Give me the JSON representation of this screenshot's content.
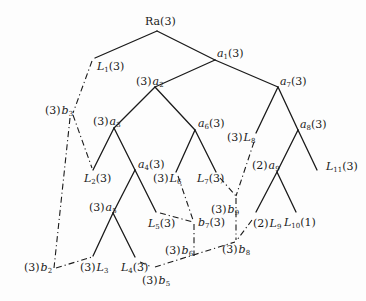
{
  "diagram": {
    "type": "tree",
    "root": "Ra(3)",
    "nodes": [
      {
        "id": "Ra",
        "label": "Ra",
        "mult": "3",
        "x": 157,
        "y": 31
      },
      {
        "id": "L1",
        "label": "L",
        "sub": "1",
        "mult": "3",
        "x": 95,
        "y": 58
      },
      {
        "id": "a1",
        "label": "a",
        "sub": "1",
        "mult": "3",
        "x": 215,
        "y": 60
      },
      {
        "id": "a2",
        "label": "a",
        "sub": "2",
        "mult": "3",
        "x": 155,
        "y": 87
      },
      {
        "id": "a7",
        "label": "a",
        "sub": "7",
        "mult": "3",
        "x": 278,
        "y": 87
      },
      {
        "id": "a3",
        "label": "a",
        "sub": "3",
        "mult": "3",
        "x": 114,
        "y": 128
      },
      {
        "id": "a6",
        "label": "a",
        "sub": "6",
        "mult": "3",
        "x": 195,
        "y": 130
      },
      {
        "id": "L8",
        "label": "L",
        "sub": "8",
        "mult": "3",
        "x": 254,
        "y": 145
      },
      {
        "id": "a8",
        "label": "a",
        "sub": "8",
        "mult": "3",
        "x": 298,
        "y": 130
      },
      {
        "id": "L2",
        "label": "L",
        "sub": "2",
        "mult": "3",
        "x": 93,
        "y": 170
      },
      {
        "id": "a4",
        "label": "a",
        "sub": "4",
        "mult": "3",
        "x": 135,
        "y": 170
      },
      {
        "id": "L6",
        "label": "L",
        "sub": "6",
        "mult": "3",
        "x": 172,
        "y": 172
      },
      {
        "id": "L7",
        "label": "L",
        "sub": "7",
        "mult": "3",
        "x": 220,
        "y": 172
      },
      {
        "id": "a9",
        "label": "a",
        "sub": "9",
        "mult": "2",
        "x": 277,
        "y": 172
      },
      {
        "id": "L11",
        "label": "L",
        "sub": "11",
        "mult": "3",
        "x": 316,
        "y": 172
      },
      {
        "id": "a5",
        "label": "a",
        "sub": "5",
        "mult": "3",
        "x": 113,
        "y": 213
      },
      {
        "id": "L5",
        "label": "L",
        "sub": "5",
        "mult": "3",
        "x": 156,
        "y": 212
      },
      {
        "id": "L9",
        "label": "L",
        "sub": "9",
        "mult": "2",
        "x": 256,
        "y": 215
      },
      {
        "id": "L10",
        "label": "L",
        "sub": "10",
        "mult": "1",
        "x": 297,
        "y": 215
      },
      {
        "id": "L3",
        "label": "L",
        "sub": "3",
        "mult": "3",
        "x": 93,
        "y": 256
      },
      {
        "id": "L4",
        "label": "L",
        "sub": "4",
        "mult": "3",
        "x": 135,
        "y": 257
      },
      {
        "id": "b2",
        "label": "b",
        "sub": "2",
        "mult": "3",
        "x": 54,
        "y": 268
      },
      {
        "id": "b3",
        "label": "b",
        "sub": "3",
        "mult": "3",
        "x": 73,
        "y": 114
      },
      {
        "id": "b5",
        "label": "b",
        "sub": "5",
        "mult": "3",
        "x": 152,
        "y": 267
      },
      {
        "id": "b6",
        "label": "b",
        "sub": "6",
        "mult": "3",
        "x": 193,
        "y": 252
      },
      {
        "id": "b7",
        "label": "b",
        "sub": "7",
        "mult": "3",
        "x": 193,
        "y": 222
      },
      {
        "id": "b8",
        "label": "b",
        "sub": "8",
        "mult": "3",
        "x": 236,
        "y": 240
      },
      {
        "id": "b9",
        "label": "b",
        "sub": "9",
        "mult": "3",
        "x": 236,
        "y": 198
      }
    ],
    "solid_edges": [
      [
        "Ra",
        "L1"
      ],
      [
        "Ra",
        "a1"
      ],
      [
        "a1",
        "a2"
      ],
      [
        "a1",
        "a7"
      ],
      [
        "a2",
        "a3"
      ],
      [
        "a2",
        "a6"
      ],
      [
        "a3",
        "L2"
      ],
      [
        "a3",
        "a4"
      ],
      [
        "a4",
        "a5"
      ],
      [
        "a4",
        "L5"
      ],
      [
        "a5",
        "L3"
      ],
      [
        "a5",
        "L4"
      ],
      [
        "a6",
        "L6"
      ],
      [
        "a6",
        "L7"
      ],
      [
        "a7",
        "L8"
      ],
      [
        "a7",
        "a8"
      ],
      [
        "a8",
        "a9"
      ],
      [
        "a8",
        "L11"
      ],
      [
        "a9",
        "L9"
      ],
      [
        "a9",
        "L10"
      ]
    ],
    "dashed_edges": [
      [
        "L1",
        "b3"
      ],
      [
        "b3",
        "L2"
      ],
      [
        "b3",
        "b2"
      ],
      [
        "b2",
        "L3"
      ],
      [
        "L4",
        "b5"
      ],
      [
        "b5",
        "b6"
      ],
      [
        "b6",
        "b8"
      ],
      [
        "b6",
        "b7"
      ],
      [
        "L5",
        "b7"
      ],
      [
        "L6",
        "b7"
      ],
      [
        "L7",
        "b9"
      ],
      [
        "L8",
        "b9"
      ],
      [
        "b9",
        "b8"
      ],
      [
        "L9",
        "b8"
      ]
    ]
  },
  "labels": {
    "Ra": "Ra(3)",
    "L1": "L1(3)",
    "a1": "a1(3)",
    "a2": "(3) a2",
    "a7": "a7(3)",
    "b3": "(3) b3",
    "a3": "(3) a3",
    "a6": "a6(3)",
    "L8": "(3) L8",
    "a8": "a8(3)",
    "L2": "L2(3)",
    "a4": "a4(3)",
    "L6": "(3) L6",
    "L7": "L7(3)",
    "a9": "(2) a9",
    "L11": "L11(3)",
    "a5": "(3) a5",
    "L5": "L5(3)",
    "b7": "b7(3)",
    "b9": "(3) b9",
    "L9": "(2) L9",
    "L10": "L10(1)",
    "b6": "(3) b6",
    "b8": "(3) b8",
    "b2": "(3) b2",
    "L3": "(3) L3",
    "L4": "L4(3)",
    "b5": "(3) b5"
  },
  "parts": {
    "Ra": {
      "pre": "",
      "main": "Ra",
      "sub": "",
      "post": "(3)"
    },
    "L1": {
      "pre": "",
      "main": "L",
      "sub": "1",
      "post": "(3)"
    },
    "a1": {
      "pre": "",
      "main": "a",
      "sub": "1",
      "post": "(3)"
    },
    "a2": {
      "pre": "(3)",
      "main": "a",
      "sub": "2",
      "post": ""
    },
    "a7": {
      "pre": "",
      "main": "a",
      "sub": "7",
      "post": "(3)"
    },
    "b3": {
      "pre": "(3)",
      "main": "b",
      "sub": "3",
      "post": ""
    },
    "a3": {
      "pre": "(3)",
      "main": "a",
      "sub": "3",
      "post": ""
    },
    "a6": {
      "pre": "",
      "main": "a",
      "sub": "6",
      "post": "(3)"
    },
    "L8": {
      "pre": "(3)",
      "main": "L",
      "sub": "8",
      "post": ""
    },
    "a8": {
      "pre": "",
      "main": "a",
      "sub": "8",
      "post": "(3)"
    },
    "L2": {
      "pre": "",
      "main": "L",
      "sub": "2",
      "post": "(3)"
    },
    "a4": {
      "pre": "",
      "main": "a",
      "sub": "4",
      "post": "(3)"
    },
    "L6": {
      "pre": "(3)",
      "main": "L",
      "sub": "6",
      "post": ""
    },
    "L7": {
      "pre": "",
      "main": "L",
      "sub": "7",
      "post": "(3)"
    },
    "a9": {
      "pre": "(2)",
      "main": "a",
      "sub": "9",
      "post": ""
    },
    "L11": {
      "pre": "",
      "main": "L",
      "sub": "11",
      "post": "(3)"
    },
    "a5": {
      "pre": "(3)",
      "main": "a",
      "sub": "5",
      "post": ""
    },
    "L5": {
      "pre": "",
      "main": "L",
      "sub": "5",
      "post": "(3)"
    },
    "b7": {
      "pre": "",
      "main": "b",
      "sub": "7",
      "post": "(3)"
    },
    "b9": {
      "pre": "(3)",
      "main": "b",
      "sub": "9",
      "post": ""
    },
    "L9": {
      "pre": "(2)",
      "main": "L",
      "sub": "9",
      "post": ""
    },
    "L10": {
      "pre": "",
      "main": "L",
      "sub": "10",
      "post": "(1)"
    },
    "b6": {
      "pre": "(3)",
      "main": "b",
      "sub": "6",
      "post": ""
    },
    "b8": {
      "pre": "(3)",
      "main": "b",
      "sub": "8",
      "post": ""
    },
    "b2": {
      "pre": "(3)",
      "main": "b",
      "sub": "2",
      "post": ""
    },
    "L3": {
      "pre": "(3)",
      "main": "L",
      "sub": "3",
      "post": ""
    },
    "L4": {
      "pre": "",
      "main": "L",
      "sub": "4",
      "post": "(3)"
    },
    "b5": {
      "pre": "(3)",
      "main": "b",
      "sub": "5",
      "post": ""
    }
  }
}
